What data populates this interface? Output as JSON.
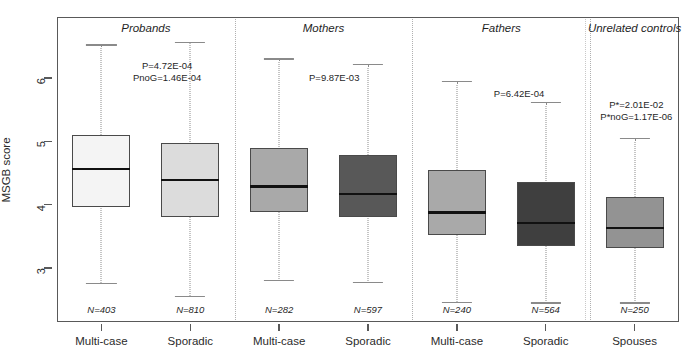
{
  "chart_data": {
    "type": "box",
    "title": "",
    "xlabel": "",
    "ylabel": "MSGB score",
    "ylim": [
      2.3,
      6.8
    ],
    "yticks": [
      3,
      4,
      5,
      6
    ],
    "ytick_labels": [
      "3",
      "4",
      "5",
      "6"
    ],
    "grid": false,
    "legend": "none",
    "panels": [
      {
        "name": "Probands",
        "annotations": [
          "P=4.72E-04",
          "PnoG=1.46E-04"
        ],
        "boxes": [
          {
            "label": "Multi-case",
            "n_label": "N=403",
            "n": 403,
            "whisker_low": 2.76,
            "q1": 3.96,
            "median": 4.56,
            "q3": 5.1,
            "whisker_high": 6.52,
            "fill": "#f4f4f4"
          },
          {
            "label": "Sporadic",
            "n_label": "N=810",
            "n": 810,
            "whisker_low": 2.55,
            "q1": 3.81,
            "median": 4.39,
            "q3": 4.97,
            "whisker_high": 6.56,
            "fill": "#dcdcdc"
          }
        ]
      },
      {
        "name": "Mothers",
        "annotations": [
          "P=9.87E-03"
        ],
        "boxes": [
          {
            "label": "Multi-case",
            "n_label": "N=282",
            "n": 282,
            "whisker_low": 2.8,
            "q1": 3.89,
            "median": 4.29,
            "q3": 4.9,
            "whisker_high": 6.3,
            "fill": "#a9a9a9"
          },
          {
            "label": "Sporadic",
            "n_label": "N=597",
            "n": 597,
            "whisker_low": 2.77,
            "q1": 3.8,
            "median": 4.17,
            "q3": 4.78,
            "whisker_high": 6.21,
            "fill": "#585858"
          }
        ]
      },
      {
        "name": "Fathers",
        "annotations": [
          "P=6.42E-04"
        ],
        "boxes": [
          {
            "label": "Multi-case",
            "n_label": "N=240",
            "n": 240,
            "whisker_low": 2.46,
            "q1": 3.52,
            "median": 3.88,
            "q3": 4.54,
            "whisker_high": 5.94,
            "fill": "#a9a9a9"
          },
          {
            "label": "Sporadic",
            "n_label": "N=564",
            "n": 564,
            "whisker_low": 2.45,
            "q1": 3.34,
            "median": 3.71,
            "q3": 4.36,
            "whisker_high": 5.61,
            "fill": "#3f3f3f"
          }
        ]
      },
      {
        "name": "Unrelated controls",
        "annotations": [
          "P*=2.01E-02",
          "P*noG=1.17E-06"
        ],
        "boxes": [
          {
            "label": "Spouses",
            "n_label": "N=250",
            "n": 250,
            "whisker_low": 2.45,
            "q1": 3.31,
            "median": 3.63,
            "q3": 4.12,
            "whisker_high": 5.04,
            "fill": "#939393"
          }
        ]
      }
    ]
  },
  "colors": {
    "frame": "#595959",
    "median": "#111111",
    "box_border": "#4a4a4a",
    "whisker": "#8a8a8a",
    "separator": "#b0b0b0",
    "text": "#1f1f1f",
    "background": "#ffffff"
  }
}
